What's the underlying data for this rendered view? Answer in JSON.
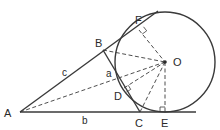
{
  "diagram": {
    "colors": {
      "stroke": "#3a3a3a",
      "text": "#2a2a2a",
      "background": "#ffffff"
    },
    "points": {
      "A": {
        "label": "A",
        "x": 20,
        "y": 112
      },
      "B": {
        "label": "B",
        "x": 103,
        "y": 50
      },
      "C": {
        "label": "C",
        "x": 140,
        "y": 112
      },
      "O": {
        "label": "O",
        "x": 165,
        "y": 62
      },
      "D": {
        "label": "D",
        "x": 124,
        "y": 88
      },
      "E": {
        "label": "E",
        "x": 165,
        "y": 112
      },
      "F": {
        "label": "F",
        "x": 139,
        "y": 30
      }
    },
    "sides": {
      "a": "a",
      "b": "b",
      "c": "c"
    },
    "circle": {
      "center": "O",
      "radius": 50
    },
    "right_angle_marks": [
      "F",
      "D",
      "E"
    ]
  }
}
